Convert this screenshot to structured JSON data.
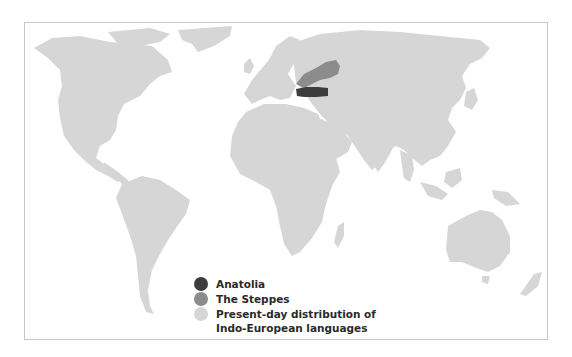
{
  "map": {
    "colors": {
      "background": "#ffffff",
      "land": "#d6d6d6",
      "anatolia": "#3d3d3d",
      "steppes": "#8c8c8c",
      "frame_border": "#c8c8c8"
    }
  },
  "legend": {
    "items": [
      {
        "label": "Anatolia",
        "color": "#3d3d3d"
      },
      {
        "label": "The Steppes",
        "color": "#8c8c8c"
      },
      {
        "label": "Present-day distribution of",
        "label2": "Indo-European languages",
        "color": "#d6d6d6"
      }
    ]
  }
}
